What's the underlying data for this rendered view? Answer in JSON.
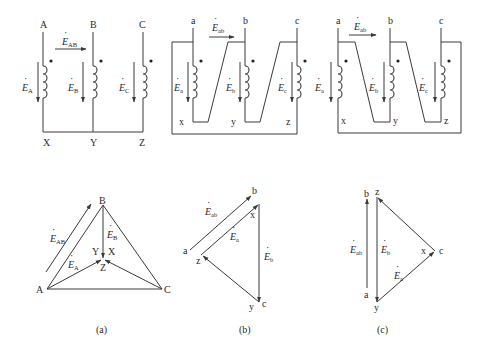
{
  "figure": {
    "colors": {
      "ink": "#3a3a3a",
      "background": "#ffffff"
    },
    "circuit_a": {
      "terminals_top": [
        "A",
        "B",
        "C"
      ],
      "terminals_bottom": [
        "X",
        "Y",
        "Z"
      ],
      "emf_labels": [
        {
          "base": "E",
          "sub": "A"
        },
        {
          "base": "E",
          "sub": "B"
        },
        {
          "base": "E",
          "sub": "C"
        }
      ],
      "line_emf": {
        "base": "E",
        "sub": "AB"
      }
    },
    "circuit_b": {
      "terminals_top": [
        "a",
        "b",
        "c"
      ],
      "terminals_bottom": [
        "x",
        "y",
        "z"
      ],
      "emf_labels": [
        {
          "base": "E",
          "sub": "a"
        },
        {
          "base": "E",
          "sub": "b"
        },
        {
          "base": "E",
          "sub": "c"
        }
      ],
      "line_emf": {
        "base": "E",
        "sub": "ab"
      }
    },
    "circuit_c": {
      "terminals_top": [
        "a",
        "b",
        "c"
      ],
      "terminals_bottom": [
        "x",
        "y",
        "z"
      ],
      "emf_labels": [
        {
          "base": "E",
          "sub": "a"
        },
        {
          "base": "E",
          "sub": "b"
        },
        {
          "base": "E",
          "sub": "c"
        }
      ],
      "line_emf": {
        "base": "E",
        "sub": "ab"
      }
    },
    "phasor_a": {
      "vertices": [
        "A",
        "B",
        "C"
      ],
      "neutral_labels": [
        "Y",
        "X",
        "Z"
      ],
      "emf_ab": {
        "base": "E",
        "sub": "AB"
      },
      "emf_a": {
        "base": "E",
        "sub": "A"
      },
      "emf_b": {
        "base": "E",
        "sub": "B"
      }
    },
    "phasor_b": {
      "points": [
        "a",
        "b",
        "x",
        "z",
        "y",
        "c"
      ],
      "emf_ab": {
        "base": "E",
        "sub": "ab"
      },
      "emf_a": {
        "base": "E",
        "sub": "a"
      },
      "emf_b": {
        "base": "E",
        "sub": "b"
      }
    },
    "phasor_c": {
      "points": [
        "b",
        "z",
        "a",
        "y",
        "x",
        "c"
      ],
      "emf_ab": {
        "base": "E",
        "sub": "ab"
      },
      "emf_a": {
        "base": "E",
        "sub": "a"
      },
      "emf_b": {
        "base": "E",
        "sub": "b"
      }
    },
    "captions": [
      "(a)",
      "(b)",
      "(c)"
    ]
  }
}
